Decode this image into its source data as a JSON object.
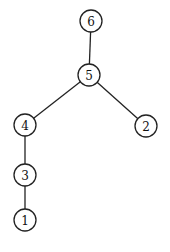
{
  "diagram": {
    "type": "tree",
    "colors": {
      "stroke": "#222222",
      "fill": "#ffffff",
      "text": "#111111"
    },
    "node_radius": 11,
    "nodes": [
      {
        "id": "6",
        "label": "6",
        "x": 91,
        "y": 21
      },
      {
        "id": "5",
        "label": "5",
        "x": 89,
        "y": 75
      },
      {
        "id": "4",
        "label": "4",
        "x": 25,
        "y": 125
      },
      {
        "id": "2",
        "label": "2",
        "x": 146,
        "y": 126
      },
      {
        "id": "3",
        "label": "3",
        "x": 25,
        "y": 175
      },
      {
        "id": "1",
        "label": "1",
        "x": 25,
        "y": 220
      }
    ],
    "edges": [
      {
        "from": "6",
        "to": "5"
      },
      {
        "from": "5",
        "to": "4"
      },
      {
        "from": "5",
        "to": "2"
      },
      {
        "from": "4",
        "to": "3"
      },
      {
        "from": "3",
        "to": "1"
      }
    ]
  }
}
